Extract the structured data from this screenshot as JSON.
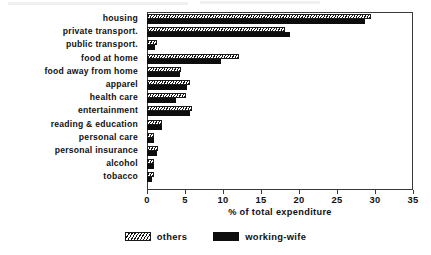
{
  "chart_data": {
    "type": "bar",
    "orientation": "horizontal",
    "title": "",
    "xlabel": "% of total expenditure",
    "ylabel": "",
    "xlim": [
      0,
      35
    ],
    "xticks": [
      0,
      5,
      10,
      15,
      20,
      25,
      30,
      35
    ],
    "xtick_labels": [
      "0",
      "5",
      "10",
      "15",
      "20",
      "25",
      "30",
      "35"
    ],
    "grid": false,
    "legend_position": "bottom-center",
    "categories": [
      "housing",
      "private transport.",
      "public transport.",
      "food at home",
      "food away from home",
      "apparel",
      "health care",
      "entertainment",
      "reading & education",
      "personal care",
      "personal insurance",
      "alcohol",
      "tobacco"
    ],
    "series": [
      {
        "name": "others",
        "pattern": "diagonal-hatch",
        "color": "#141414",
        "values": [
          29.5,
          18.2,
          1.3,
          12.1,
          4.5,
          5.7,
          5.1,
          5.9,
          2.0,
          0.9,
          1.5,
          0.9,
          0.9
        ]
      },
      {
        "name": "working-wife",
        "pattern": "solid",
        "color": "#0d0d0d",
        "values": [
          28.7,
          18.8,
          1.0,
          9.7,
          4.3,
          5.3,
          3.8,
          5.6,
          2.0,
          0.9,
          1.3,
          0.9,
          0.7
        ]
      }
    ]
  },
  "legend": {
    "items": [
      {
        "label": "others"
      },
      {
        "label": "working-wife"
      }
    ]
  }
}
